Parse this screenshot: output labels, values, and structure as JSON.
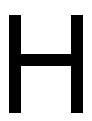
{
  "glyph": {
    "character": "H",
    "color": "#000000",
    "background": "#ffffff"
  }
}
